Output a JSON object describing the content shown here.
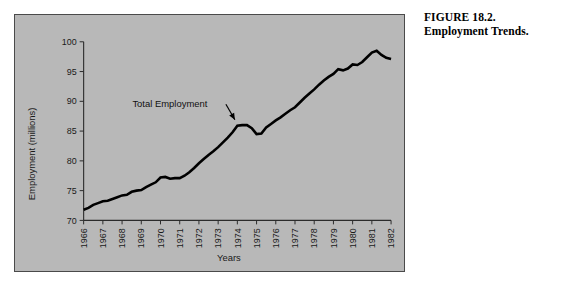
{
  "caption": {
    "line1": "FIGURE 18.2.",
    "line2": "Employment Trends."
  },
  "chart_data": {
    "type": "line",
    "title": "",
    "xlabel": "Years",
    "ylabel": "Employment (millions)",
    "xlim": [
      1966,
      1982
    ],
    "ylim": [
      70,
      100
    ],
    "yticks": [
      70,
      75,
      80,
      85,
      90,
      95,
      100
    ],
    "grid": false,
    "legend": null,
    "categories": [
      "1966",
      "1967",
      "1968",
      "1969",
      "1970",
      "1971",
      "1972",
      "1973",
      "1974",
      "1975",
      "1976",
      "1977",
      "1978",
      "1979",
      "1980",
      "1981",
      "1982"
    ],
    "x": [
      1966,
      1967,
      1968,
      1969,
      1970,
      1971,
      1972,
      1973,
      1974,
      1975,
      1976,
      1977,
      1978,
      1979,
      1980,
      1981,
      1982
    ],
    "series": [
      {
        "name": "Total Employment",
        "values": [
          71.8,
          73.2,
          74.4,
          75.6,
          77.2,
          78.3,
          79.6,
          81.4,
          85.9,
          84.5,
          86.8,
          89.0,
          92.0,
          94.6,
          96.2,
          98.2,
          97.1
        ],
        "quarterly_x": [
          1966.0,
          1966.25,
          1966.5,
          1966.75,
          1967.0,
          1967.25,
          1967.5,
          1967.75,
          1968.0,
          1968.25,
          1968.5,
          1968.75,
          1969.0,
          1969.25,
          1969.5,
          1969.75,
          1970.0,
          1970.25,
          1970.5,
          1970.75,
          1971.0,
          1971.25,
          1971.5,
          1971.75,
          1972.0,
          1972.25,
          1972.5,
          1972.75,
          1973.0,
          1973.25,
          1973.5,
          1973.75,
          1974.0,
          1974.25,
          1974.5,
          1974.75,
          1975.0,
          1975.25,
          1975.5,
          1975.75,
          1976.0,
          1976.25,
          1976.5,
          1976.75,
          1977.0,
          1977.25,
          1977.5,
          1977.75,
          1978.0,
          1978.25,
          1978.5,
          1978.75,
          1979.0,
          1979.25,
          1979.5,
          1979.75,
          1980.0,
          1980.25,
          1980.5,
          1980.75,
          1981.0,
          1981.25,
          1981.5,
          1981.75,
          1982.0
        ],
        "quarterly_values": [
          71.8,
          72.1,
          72.6,
          72.9,
          73.2,
          73.3,
          73.6,
          73.9,
          74.2,
          74.3,
          74.8,
          75.0,
          75.1,
          75.6,
          76.0,
          76.4,
          77.2,
          77.3,
          77.0,
          77.1,
          77.1,
          77.5,
          78.1,
          78.8,
          79.6,
          80.3,
          81.0,
          81.6,
          82.3,
          83.1,
          83.9,
          84.8,
          85.9,
          86.0,
          86.0,
          85.5,
          84.5,
          84.6,
          85.6,
          86.2,
          86.8,
          87.3,
          87.9,
          88.5,
          89.0,
          89.8,
          90.6,
          91.3,
          92.0,
          92.8,
          93.5,
          94.1,
          94.6,
          95.4,
          95.2,
          95.5,
          96.2,
          96.1,
          96.6,
          97.4,
          98.2,
          98.5,
          97.8,
          97.3,
          97.1
        ]
      }
    ],
    "annotations": [
      {
        "text": "Total Employment",
        "points_to_year": 1974,
        "points_to_value": 86.0
      }
    ]
  }
}
